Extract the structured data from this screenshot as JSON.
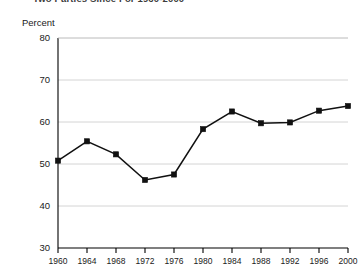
{
  "title": {
    "text": "Two Parties Since For 1960-2000",
    "clipped": true
  },
  "axis": {
    "ylabel": "Percent"
  },
  "chart_data": {
    "type": "line",
    "title": "Two Parties Since For 1960-2000",
    "xlabel": "",
    "ylabel": "Percent",
    "categories": [
      "1960",
      "1964",
      "1968",
      "1972",
      "1976",
      "1980",
      "1984",
      "1988",
      "1992",
      "1996",
      "2000"
    ],
    "x": [
      1960,
      1964,
      1968,
      1972,
      1976,
      1980,
      1984,
      1988,
      1992,
      1996,
      2000
    ],
    "values": [
      50.8,
      55.4,
      52.3,
      46.2,
      47.5,
      58.3,
      62.5,
      59.7,
      59.9,
      62.7,
      63.8
    ],
    "ylim": [
      30,
      80
    ],
    "yticks": [
      30,
      40,
      50,
      60,
      70,
      80
    ],
    "ytick_labels": [
      "30",
      "40",
      "50",
      "60",
      "70",
      "80"
    ],
    "xtick_labels": [
      "1960",
      "1964",
      "1968",
      "1972",
      "1976",
      "1980",
      "1984",
      "1988",
      "1992",
      "1996",
      "2000"
    ],
    "grid": "horizontal",
    "legend": "none",
    "marker": "square",
    "series_color": "#111111",
    "grid_color": "#c9c9c9"
  }
}
